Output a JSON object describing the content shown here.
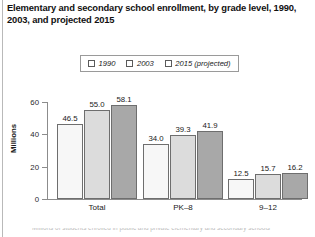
{
  "figure": {
    "title": "Elementary and secondary school enrollment, by grade level, 1990, 2003, and projected 2015",
    "caption_cutoff": "Millions of students enrolled in public and private elementary and secondary schools"
  },
  "legend": {
    "items": [
      {
        "label": "1990",
        "color": "#f7f7f7"
      },
      {
        "label": "2003",
        "color": "#dcdcdc"
      },
      {
        "label": "2015 (projected)",
        "color": "#a8a8a8"
      }
    ]
  },
  "axes": {
    "y_title": "Millions",
    "y_ticks": [
      "0",
      "20",
      "40",
      "60"
    ]
  },
  "chart_data": {
    "type": "bar",
    "title": "Elementary and secondary school enrollment, by grade level, 1990, 2003, and projected 2015",
    "xlabel": "",
    "ylabel": "Millions",
    "ylim": [
      0,
      60
    ],
    "yticks": [
      0,
      20,
      40,
      60
    ],
    "grid": false,
    "legend_position": "top-center",
    "categories": [
      "Total",
      "PK–8",
      "9–12"
    ],
    "series": [
      {
        "name": "1990",
        "color": "#f7f7f7",
        "values": [
          46.5,
          34.0,
          12.5
        ],
        "labels": [
          "46.5",
          "34.0",
          "12.5"
        ]
      },
      {
        "name": "2003",
        "color": "#dcdcdc",
        "values": [
          55.0,
          39.3,
          15.7
        ],
        "labels": [
          "55.0",
          "39.3",
          "15.7"
        ]
      },
      {
        "name": "2015 (projected)",
        "color": "#a8a8a8",
        "values": [
          58.1,
          41.9,
          16.2
        ],
        "labels": [
          "58.1",
          "41.9",
          "16.2"
        ]
      }
    ]
  }
}
